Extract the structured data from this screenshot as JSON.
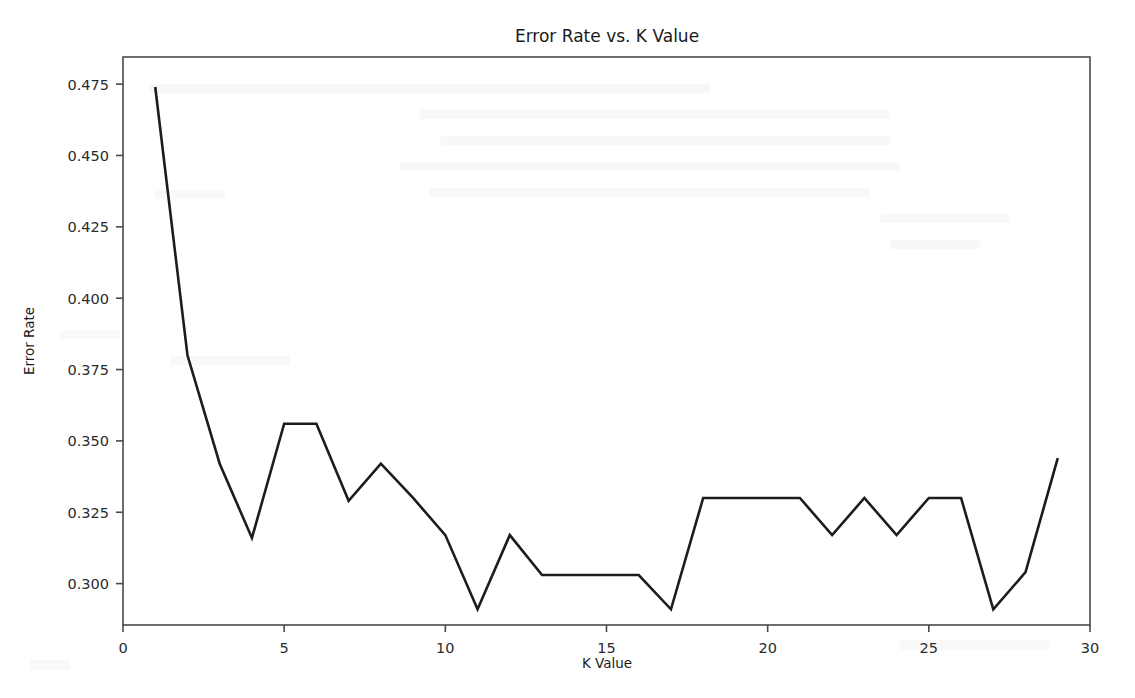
{
  "figure": {
    "background_color": "#ffffff",
    "line_color": "#1c1c1c",
    "axis_color": "#4a4a4a"
  },
  "chart_data": {
    "type": "line",
    "title": "Error Rate vs. K Value",
    "xlabel": "K Value",
    "ylabel": "Error Rate",
    "xlim": [
      0,
      30
    ],
    "ylim": [
      0.2855,
      0.4845
    ],
    "grid": false,
    "legend": null,
    "xticks": [
      0,
      5,
      10,
      15,
      20,
      25,
      30
    ],
    "xticklabels": [
      "0",
      "5",
      "10",
      "15",
      "20",
      "25",
      "30"
    ],
    "yticks": [
      0.3,
      0.325,
      0.35,
      0.375,
      0.4,
      0.425,
      0.45,
      0.475
    ],
    "yticklabels": [
      "0.300",
      "0.325",
      "0.350",
      "0.375",
      "0.400",
      "0.425",
      "0.450",
      "0.475"
    ],
    "x": [
      1,
      2,
      3,
      4,
      5,
      6,
      7,
      8,
      9,
      10,
      11,
      12,
      13,
      14,
      15,
      16,
      17,
      18,
      19,
      20,
      21,
      22,
      23,
      24,
      25,
      26,
      27,
      28,
      29
    ],
    "values": [
      0.474,
      0.38,
      0.342,
      0.316,
      0.356,
      0.356,
      0.329,
      0.342,
      0.33,
      0.317,
      0.291,
      0.317,
      0.303,
      0.303,
      0.303,
      0.303,
      0.291,
      0.33,
      0.33,
      0.33,
      0.33,
      0.317,
      0.33,
      0.317,
      0.33,
      0.33,
      0.291,
      0.304,
      0.344
    ],
    "series": [
      {
        "name": "Error Rate",
        "values": [
          0.474,
          0.38,
          0.342,
          0.316,
          0.356,
          0.356,
          0.329,
          0.342,
          0.33,
          0.317,
          0.291,
          0.317,
          0.303,
          0.303,
          0.303,
          0.303,
          0.291,
          0.33,
          0.33,
          0.33,
          0.33,
          0.317,
          0.33,
          0.317,
          0.33,
          0.33,
          0.291,
          0.304,
          0.344
        ]
      }
    ]
  }
}
